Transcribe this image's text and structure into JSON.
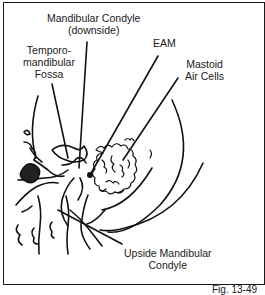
{
  "figure": {
    "caption": "Fig. 13-49",
    "labels": {
      "mandibular_condyle_downside": [
        "Mandibular Condyle",
        "(downside)"
      ],
      "temporomandibular_fossa": [
        "Temporo-",
        "mandibular",
        "Fossa"
      ],
      "eam": "EAM",
      "mastoid_air_cells": [
        "Mastoid",
        "Air Cells"
      ],
      "upside_mandibular_condyle": [
        "Upside Mandibular",
        "Condyle"
      ]
    }
  }
}
